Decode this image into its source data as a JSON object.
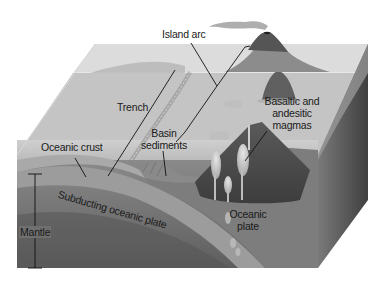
{
  "diagram": {
    "labels": {
      "island_arc": "Island arc",
      "trench": "Trench",
      "basin_sediments_line1": "Basin",
      "basin_sediments_line2": "sediments",
      "basaltic_line1": "Basaltic and",
      "basaltic_line2": "andesitic",
      "basaltic_line3": "magmas",
      "oceanic_crust": "Oceanic crust",
      "subducting_plate": "Subducting oceanic plate",
      "mantle": "Mantle",
      "oceanic_plate_line1": "Oceanic",
      "oceanic_plate_line2": "plate"
    },
    "colors": {
      "sea_surface": "#d9d9d9",
      "seafloor_top": "#bdbdbd",
      "water_front": "#c8c8c8",
      "crust": "#8f8f8f",
      "mantle": "#6f6f6f",
      "mantle_dark": "#5a5a5a",
      "volcano": "#4d4d4d",
      "magma": "#d0d0d0",
      "right_face": "#555555",
      "leader_line": "#111111"
    }
  }
}
